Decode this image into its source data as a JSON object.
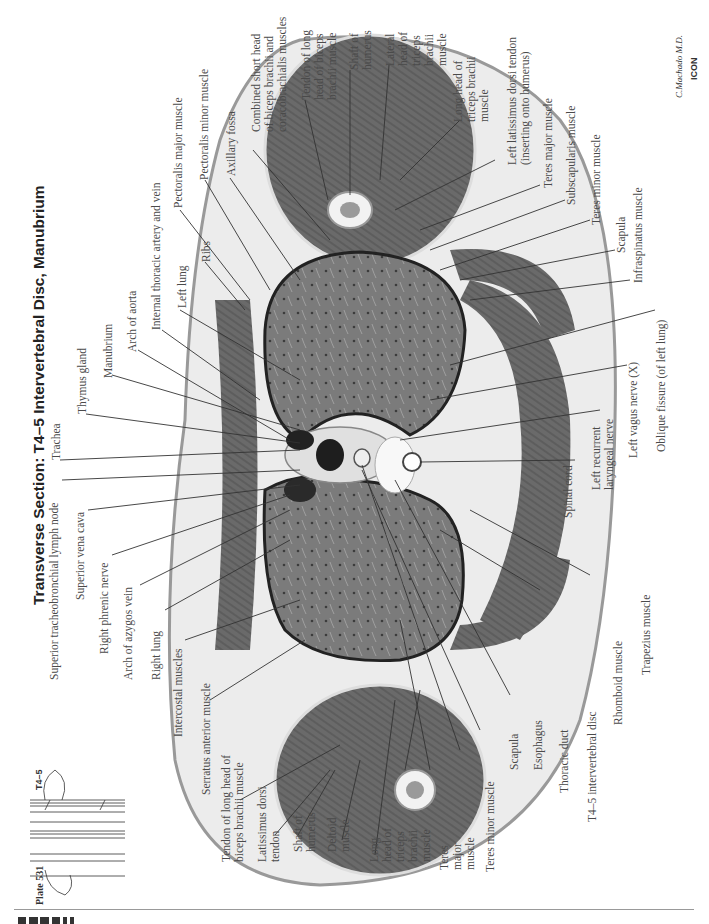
{
  "plate": {
    "title": "Transverse Section: T4–5 Intervertebral Disc, Manubrium",
    "plate_number": "Plate 531",
    "level_marker": "T4–5",
    "signature": "C.Machado M.D.",
    "publisher_mark": "ICON"
  },
  "labels": {
    "trachea": "Trachea",
    "thymus_gland": "Thymus gland",
    "manubrium": "Manubrium",
    "arch_of_aorta": "Arch of aorta",
    "internal_thoracic": "Internal thoracic artery and vein",
    "left_lung": "Left lung",
    "ribs": "Ribs",
    "pectoralis_major": "Pectoralis major muscle",
    "pectoralis_minor": "Pectoralis minor muscle",
    "axillary_fossa": "Axillary fossa",
    "combined_short_head_1": "Combined short head",
    "combined_short_head_2": "of biceps brachii and",
    "combined_short_head_3": "coracobrachialis muscles",
    "tendon_long_head_biceps_l_1": "Tendon of long",
    "tendon_long_head_biceps_l_2": "head of biceps",
    "tendon_long_head_biceps_l_3": "brachii muscle",
    "shaft_humerus_l_1": "Shaft of",
    "shaft_humerus_l_2": "humerus",
    "lateral_head_triceps_1": "Lateral",
    "lateral_head_triceps_2": "head of",
    "lateral_head_triceps_3": "triceps",
    "lateral_head_triceps_4": "brachii",
    "lateral_head_triceps_5": "muscle",
    "long_head_triceps_l_1": "Long head of",
    "long_head_triceps_l_2": "triceps brachii",
    "long_head_triceps_l_3": "muscle",
    "left_latissimus_1": "Left latissimus dorsi tendon",
    "left_latissimus_2": "(inserting onto humerus)",
    "teres_major_l": "Teres major muscle",
    "subscapularis": "Subscapularis muscle",
    "teres_minor_l": "Teres minor muscle",
    "scapula_l": "Scapula",
    "infraspinatus": "Infraspinatus muscle",
    "oblique_fissure": "Oblique fissure (of left lung)",
    "left_vagus": "Left vagus nerve (X)",
    "left_recurrent_1": "Left recurrent",
    "left_recurrent_2": "laryngeal nerve",
    "spinal_cord": "Spinal cord",
    "trapezius": "Trapezius muscle",
    "rhomboid": "Rhomboid muscle",
    "t45_disc": "T4–5 intervertebral disc",
    "thoracic_duct": "Thoracic duct",
    "esophagus": "Esophagus",
    "scapula_r": "Scapula",
    "teres_minor_r": "Teres minor muscle",
    "teres_major_r_1": "Teres",
    "teres_major_r_2": "major",
    "teres_major_r_3": "muscle",
    "long_head_triceps_r_1": "Long",
    "long_head_triceps_r_2": "head of",
    "long_head_triceps_r_3": "triceps",
    "long_head_triceps_r_4": "brachii",
    "long_head_triceps_r_5": "muscle",
    "deltoid_1": "Deltoid",
    "deltoid_2": "muscle",
    "shaft_humerus_r_1": "Shaft of",
    "shaft_humerus_r_2": "humerus",
    "latissimus_r_1": "Latissimus dorsi",
    "latissimus_r_2": "tendon",
    "tendon_long_head_biceps_r_1": "Tendon of long head of",
    "tendon_long_head_biceps_r_2": "biceps brachii muscle",
    "serratus_anterior": "Serratus anterior muscle",
    "intercostal": "Intercostal muscles",
    "right_lung": "Right lung",
    "arch_of_azygos": "Arch of azygos vein",
    "right_phrenic": "Right phrenic nerve",
    "superior_vena_cava": "Superior vena cava",
    "superior_tracheobronchial": "Superior tracheobronchial lymph node"
  },
  "colors": {
    "muscle": "#6e6e6e",
    "lung": "#7a7a7a",
    "fat": "#e9e9e9",
    "skin": "#bdbdbd",
    "leader": "#333333"
  }
}
